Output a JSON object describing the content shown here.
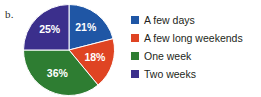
{
  "figure": {
    "panel_label": "b."
  },
  "chart_data": {
    "type": "pie",
    "title": "",
    "subtitle": "",
    "xlabel": "",
    "ylabel": "",
    "grid": false,
    "legend_position": "right",
    "start_angle_deg": 0,
    "direction": "clockwise",
    "data_labels_shown": true,
    "data_label_color": "#ffffff",
    "categories": [
      "A few days",
      "A few long weekends",
      "One week",
      "Two weeks"
    ],
    "values": [
      21,
      18,
      36,
      25
    ],
    "value_labels": [
      "21%",
      "18%",
      "36%",
      "25%"
    ],
    "colors": [
      "#1f56a5",
      "#df4423",
      "#2e7d32",
      "#3b2f8c"
    ],
    "slices": [
      {
        "label": "A few days",
        "value": 21,
        "value_label": "21%",
        "color": "#1f56a5",
        "start_deg": 0,
        "end_deg": 75.6
      },
      {
        "label": "A few long weekends",
        "value": 18,
        "value_label": "18%",
        "color": "#df4423",
        "start_deg": 75.6,
        "end_deg": 140.4
      },
      {
        "label": "One week",
        "value": 36,
        "value_label": "36%",
        "color": "#2e7d32",
        "start_deg": 140.4,
        "end_deg": 270.0
      },
      {
        "label": "Two weeks",
        "value": 25,
        "value_label": "25%",
        "color": "#3b2f8c",
        "start_deg": 270.0,
        "end_deg": 360.0
      }
    ],
    "total": 100,
    "units": "percent"
  },
  "legend": {
    "items": [
      {
        "label": "A few days",
        "color": "#1f56a5"
      },
      {
        "label": "A few long weekends",
        "color": "#df4423"
      },
      {
        "label": "One week",
        "color": "#2e7d32"
      },
      {
        "label": "Two weeks",
        "color": "#3b2f8c"
      }
    ]
  }
}
